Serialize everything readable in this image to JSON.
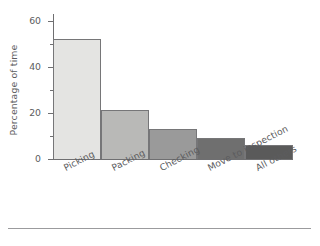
{
  "chart_data": {
    "type": "bar",
    "title": "",
    "subtitle": "",
    "xlabel": "",
    "ylabel": "Percentage of time",
    "categories": [
      "Picking",
      "Packing",
      "Checking",
      "Move to inspection",
      "All others"
    ],
    "values": [
      52,
      21,
      13,
      9,
      6
    ],
    "series": [
      {
        "name": "Percentage of time",
        "values": [
          52,
          21,
          13,
          9,
          6
        ]
      }
    ],
    "ylim": [
      0,
      63
    ],
    "xlim": [
      0,
      5
    ],
    "y_major_ticks": [
      0,
      20,
      40,
      60
    ],
    "y_minor_ticks": [
      10,
      30,
      50
    ],
    "y_tick_labels": [
      "0",
      "20",
      "40",
      "60"
    ],
    "grid": false,
    "legend": false,
    "legend_position": "none",
    "bar_colors": [
      "#e4e4e2",
      "#b9b9b7",
      "#9a9a9a",
      "#6f6f6f",
      "#5a5a5a"
    ],
    "bar_edge_color": "#767678",
    "axis_color": "#6f6f71",
    "text_color": "#5c5c5e",
    "background_color": "#ffffff",
    "category_label_rotation": -27,
    "annotations": []
  },
  "figure": {
    "bottom_rule_color": "#9b9b9d"
  }
}
